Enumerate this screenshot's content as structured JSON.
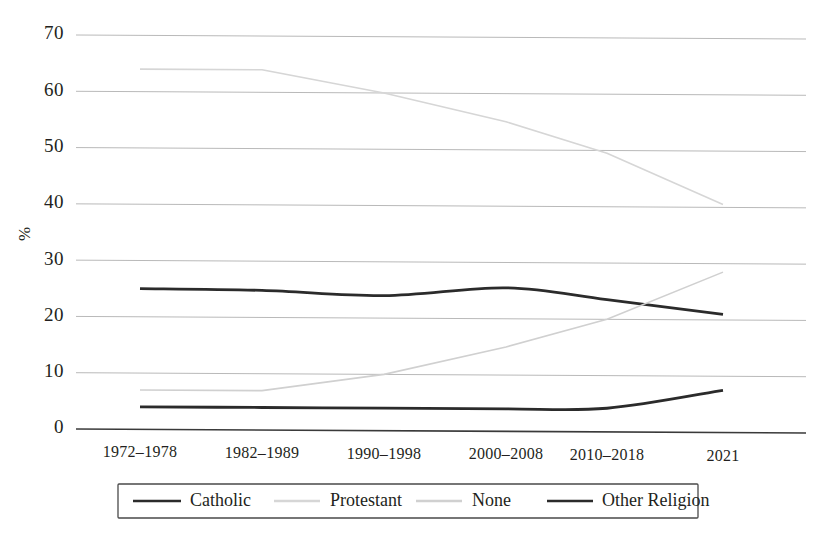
{
  "chart_data": {
    "type": "line",
    "title": "",
    "subtitle": "",
    "xlabel": "",
    "ylabel": "%",
    "categories": [
      "1972–1978",
      "1982–1989",
      "1990–1998",
      "2000–2008",
      "2010–2018",
      "2021"
    ],
    "ylim": [
      0,
      70
    ],
    "yticks": [
      0,
      10,
      20,
      30,
      40,
      50,
      60,
      70
    ],
    "ytick_labels": [
      "0",
      "10",
      "20",
      "30",
      "40",
      "50",
      "60",
      "70"
    ],
    "grid": true,
    "legend_position": "bottom",
    "series": [
      {
        "name": "Catholic",
        "color": "#2b2b2b",
        "width": 2.8,
        "values": [
          25,
          24.8,
          24,
          25.5,
          23.5,
          21
        ]
      },
      {
        "name": "Protestant",
        "color": "#d6d6d6",
        "width": 1.6,
        "values": [
          64,
          64,
          60,
          55,
          49.5,
          40.5
        ]
      },
      {
        "name": "None",
        "color": "#d0d0d0",
        "width": 1.6,
        "values": [
          7,
          7,
          10,
          15,
          20,
          28.5
        ]
      },
      {
        "name": "Other Religion",
        "color": "#2b2b2b",
        "width": 2.8,
        "values": [
          4,
          4,
          4,
          4,
          4.2,
          7.5
        ]
      }
    ]
  },
  "legend": {
    "items": [
      {
        "label": "Catholic"
      },
      {
        "label": "Protestant"
      },
      {
        "label": "None"
      },
      {
        "label": "Other Religion"
      }
    ]
  },
  "colors": {
    "gridline": "#b9b9b9",
    "axis": "#3a3a3a",
    "text": "#231f20",
    "dark_series": "#2b2b2b",
    "light_series": "#d4d4d4",
    "background": "#ffffff"
  }
}
